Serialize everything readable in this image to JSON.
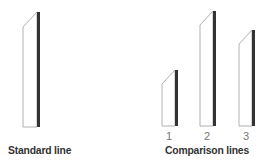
{
  "colors": {
    "bar_fill": "#ffffff",
    "bar_outline": "#b0b0b0",
    "bar_shadow": "#333333",
    "label_text": "#333333",
    "number_text": "#777777"
  },
  "standard": {
    "label": "Standard line",
    "bar": {
      "x": 23,
      "width": 14,
      "top_left": 27,
      "top_right": 12,
      "bottom": 127
    }
  },
  "comparison": {
    "label": "Comparison lines",
    "lines": [
      {
        "number": "1",
        "x": 162,
        "width": 13,
        "top_left": 84,
        "top_right": 70,
        "bottom": 126
      },
      {
        "number": "2",
        "x": 200,
        "width": 13,
        "top_left": 25,
        "top_right": 11,
        "bottom": 126
      },
      {
        "number": "3",
        "x": 239,
        "width": 13,
        "top_left": 44,
        "top_right": 30,
        "bottom": 126
      }
    ]
  }
}
